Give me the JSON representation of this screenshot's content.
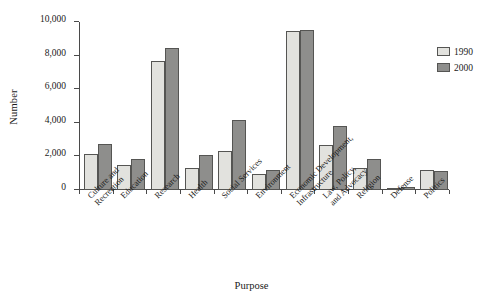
{
  "chart_data": {
    "type": "bar",
    "title": "",
    "xlabel": "Purpose",
    "ylabel": "Number",
    "ylim": [
      0,
      10000
    ],
    "ytick_values": [
      0,
      2000,
      4000,
      6000,
      8000,
      10000
    ],
    "ytick_labels": [
      "0",
      "2,000",
      "4,000",
      "6,000",
      "8,000",
      "10,000"
    ],
    "grid": false,
    "legend_position": "top-right",
    "categories": [
      "Culture and Recreation",
      "Education",
      "Research",
      "Health",
      "Social Services",
      "Environment",
      "Economic Development, Infrastructure",
      "Law, Policy, and Advocacy",
      "Religion",
      "Defense",
      "Politics"
    ],
    "category_lines": [
      [
        "Culture and",
        "Recreation"
      ],
      [
        "Education",
        ""
      ],
      [
        "Research",
        ""
      ],
      [
        "Health",
        ""
      ],
      [
        "Social Services",
        ""
      ],
      [
        "Environment",
        ""
      ],
      [
        "Economic Development,",
        "Infrastructure"
      ],
      [
        "Law, Policy,",
        "and Advocacy"
      ],
      [
        "Religion",
        ""
      ],
      [
        "Defense",
        ""
      ],
      [
        "Politics",
        ""
      ]
    ],
    "series": [
      {
        "name": "1990",
        "color": "#e2e2de",
        "values": [
          2150,
          1500,
          7650,
          1320,
          2350,
          970,
          9470,
          2650,
          1330,
          20,
          1220
        ]
      },
      {
        "name": "2000",
        "color": "#8e8e8c",
        "values": [
          2760,
          1870,
          8430,
          2060,
          4190,
          1180,
          9520,
          3820,
          1830,
          200,
          1160
        ]
      }
    ]
  },
  "legend": {
    "entries": [
      {
        "label": "1990",
        "color": "#e2e2de"
      },
      {
        "label": "2000",
        "color": "#8e8e8c"
      }
    ]
  },
  "colors": {
    "series_1990": "#e2e2de",
    "series_2000": "#8e8e8c",
    "axis": "#4a4a4a",
    "bar_border": "#555553",
    "background": "#ffffff",
    "text": "#1a1a1a"
  }
}
